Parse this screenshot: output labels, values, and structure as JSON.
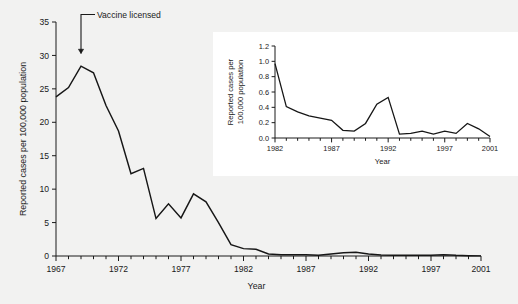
{
  "figure": {
    "background_color": "#f2f2f1",
    "line_color": "#161616",
    "axis_color": "#1a1a1a",
    "inset_background": "#ffffff"
  },
  "annotation": {
    "label": "Vaccine licensed",
    "at_year": 1969
  },
  "chart_data": [
    {
      "type": "line",
      "id": "main",
      "title": "",
      "xlabel": "Year",
      "ylabel": "Reported cases per 100,000 population",
      "xlim": [
        1967,
        2001
      ],
      "ylim": [
        0,
        35
      ],
      "xticks": [
        1967,
        1972,
        1977,
        1982,
        1987,
        1992,
        1997,
        2001
      ],
      "xtick_labels": [
        "1967",
        "1972",
        "1977",
        "1982",
        "1987",
        "1992",
        "1997",
        "2001"
      ],
      "yticks": [
        0,
        5,
        10,
        15,
        20,
        25,
        30,
        35
      ],
      "ytick_labels": [
        "0",
        "5",
        "10",
        "15",
        "20",
        "25",
        "30",
        "35"
      ],
      "minor_xticks_every": 1,
      "grid": false,
      "legend": "none",
      "x": [
        1967,
        1968,
        1969,
        1970,
        1971,
        1972,
        1973,
        1974,
        1975,
        1976,
        1977,
        1978,
        1979,
        1980,
        1981,
        1982,
        1983,
        1984,
        1985,
        1986,
        1987,
        1988,
        1989,
        1990,
        1991,
        1992,
        1993,
        1994,
        1995,
        1996,
        1997,
        1998,
        1999,
        2000,
        2001
      ],
      "values": [
        23.8,
        25.2,
        28.4,
        27.4,
        22.5,
        18.7,
        12.3,
        13.1,
        5.6,
        7.8,
        5.7,
        9.3,
        8.1,
        5.0,
        1.7,
        1.1,
        1.0,
        0.3,
        0.2,
        0.2,
        0.2,
        0.1,
        0.3,
        0.5,
        0.55,
        0.3,
        0.15,
        0.1,
        0.1,
        0.1,
        0.1,
        0.2,
        0.1,
        0.05,
        0.02
      ]
    },
    {
      "type": "line",
      "id": "inset",
      "title": "",
      "xlabel": "Year",
      "ylabel": "Reported cases per 100,000 population",
      "xlim": [
        1982,
        2001
      ],
      "ylim": [
        0.0,
        1.2
      ],
      "xticks": [
        1982,
        1987,
        1992,
        1997,
        2001
      ],
      "xtick_labels": [
        "1982",
        "1987",
        "1992",
        "1997",
        "2001"
      ],
      "yticks": [
        0.0,
        0.2,
        0.4,
        0.6,
        0.8,
        1.0,
        1.2
      ],
      "ytick_labels": [
        "0.0",
        "0.2",
        "0.4",
        "0.6",
        "0.8",
        "1.0",
        "1.2"
      ],
      "minor_xticks_every": 1,
      "grid": false,
      "legend": "none",
      "x": [
        1982,
        1983,
        1984,
        1985,
        1986,
        1987,
        1988,
        1989,
        1990,
        1991,
        1992,
        1993,
        1994,
        1995,
        1996,
        1997,
        1998,
        1999,
        2000,
        2001
      ],
      "values": [
        0.97,
        0.41,
        0.34,
        0.29,
        0.26,
        0.23,
        0.1,
        0.09,
        0.19,
        0.44,
        0.53,
        0.05,
        0.06,
        0.09,
        0.05,
        0.09,
        0.06,
        0.19,
        0.12,
        0.02
      ]
    }
  ]
}
